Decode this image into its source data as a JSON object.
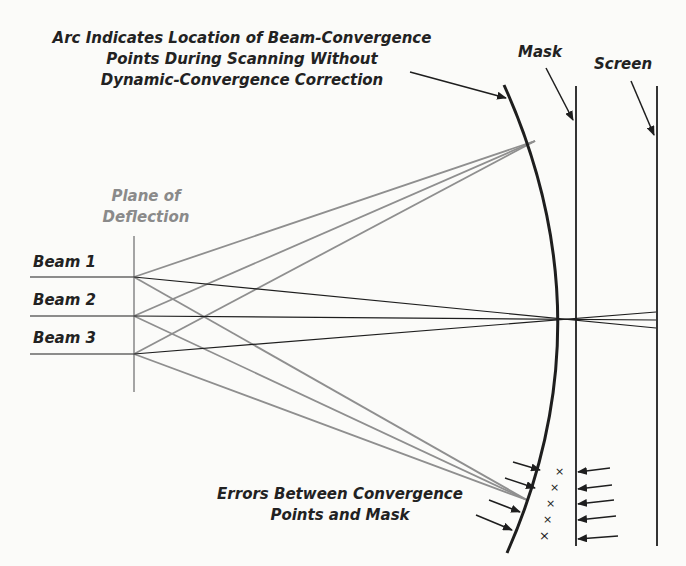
{
  "labels": {
    "arc_note": [
      "Arc Indicates Location of Beam-Convergence",
      "Points During Scanning Without",
      "Dynamic-Convergence  Correction"
    ],
    "mask": "Mask",
    "screen": "Screen",
    "plane": [
      "Plane of",
      "Deflection"
    ],
    "beams": [
      "Beam 1",
      "Beam 2",
      "Beam 3"
    ],
    "errors": [
      "Errors Between Convergence",
      "Points and Mask"
    ]
  },
  "colors": {
    "ink": "#1e1e1e",
    "gray_ray": "#8f8f8f",
    "background": "#fbfbf9"
  }
}
